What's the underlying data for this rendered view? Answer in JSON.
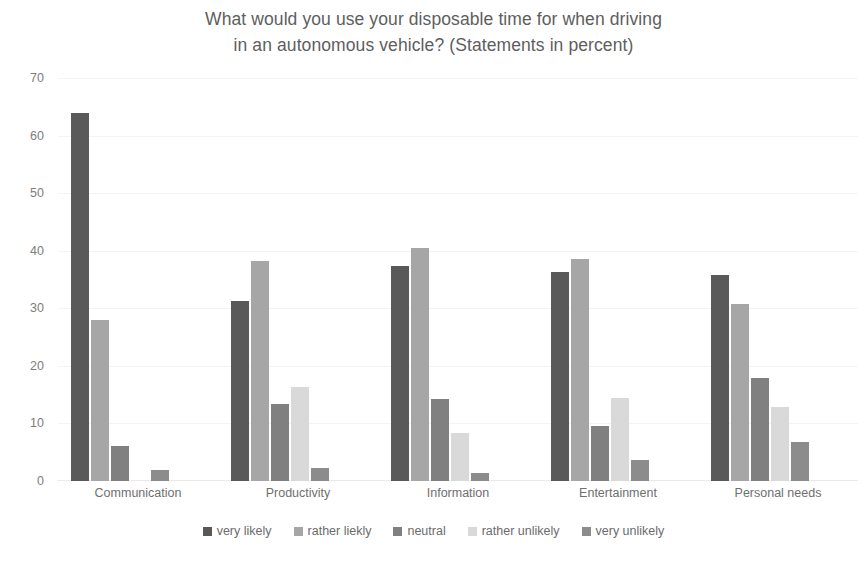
{
  "chart_data": {
    "type": "bar",
    "title": "What would you use your disposable time for when driving\nin an autonomous vehicle? (Statements in percent)",
    "xlabel": "",
    "ylabel": "",
    "ylim": [
      0,
      70
    ],
    "ytick_step": 10,
    "yticks": [
      "0",
      "10",
      "20",
      "30",
      "40",
      "50",
      "60",
      "70"
    ],
    "grid": true,
    "legend_position": "bottom",
    "categories": [
      "Communication",
      "Productivity",
      "Information",
      "Entertainment",
      "Personal needs"
    ],
    "series": [
      {
        "name": "very likely",
        "color": "#595959",
        "values": [
          64.0,
          31.3,
          37.4,
          36.3,
          35.7
        ]
      },
      {
        "name": "rather liekly",
        "color": "#a6a6a6",
        "values": [
          28.0,
          38.2,
          40.4,
          38.5,
          30.8
        ]
      },
      {
        "name": "neutral",
        "color": "#808080",
        "values": [
          6.0,
          13.3,
          14.3,
          9.5,
          17.9
        ]
      },
      {
        "name": "rather unlikely",
        "color": "#d9d9d9",
        "values": [
          0.0,
          16.3,
          8.4,
          14.4,
          12.8
        ]
      },
      {
        "name": "very unlikely",
        "color": "#8c8c8c",
        "values": [
          2.0,
          2.2,
          1.4,
          3.7,
          6.8
        ]
      }
    ]
  }
}
